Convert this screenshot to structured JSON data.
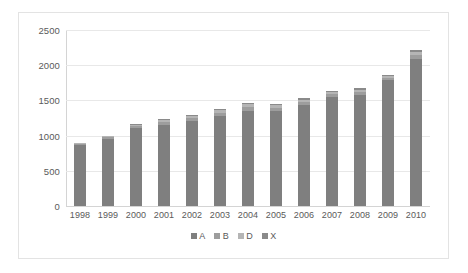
{
  "chart_data": {
    "type": "bar",
    "subtype": "stacked",
    "title": "",
    "xlabel": "",
    "ylabel": "",
    "ylim": [
      0,
      2500
    ],
    "yticks": [
      0,
      500,
      1000,
      1500,
      2000,
      2500
    ],
    "ytick_labels": [
      "0",
      "500",
      "1000",
      "1500",
      "2000",
      "2500"
    ],
    "grid": true,
    "legend_position": "bottom",
    "categories": [
      "1998",
      "1999",
      "2000",
      "2001",
      "2002",
      "2003",
      "2004",
      "2005",
      "2006",
      "2007",
      "2008",
      "2009",
      "2010"
    ],
    "series": [
      {
        "name": "A",
        "color": "#7f7f7f",
        "values": [
          860,
          955,
          1105,
          1150,
          1210,
          1275,
          1355,
          1345,
          1430,
          1545,
          1580,
          1785,
          2085
        ]
      },
      {
        "name": "B",
        "color": "#9d9d9d",
        "values": [
          25,
          22,
          28,
          38,
          42,
          50,
          52,
          48,
          45,
          42,
          40,
          35,
          55
        ]
      },
      {
        "name": "D",
        "color": "#b5b5b5",
        "values": [
          10,
          12,
          18,
          28,
          32,
          38,
          40,
          38,
          35,
          32,
          30,
          25,
          45
        ]
      },
      {
        "name": "X",
        "color": "#8a8a8a",
        "values": [
          5,
          11,
          9,
          14,
          16,
          17,
          23,
          19,
          20,
          21,
          20,
          15,
          25
        ]
      }
    ],
    "totals": [
      900,
      1000,
      1160,
      1230,
      1300,
      1380,
      1470,
      1450,
      1530,
      1640,
      1670,
      1860,
      2210
    ]
  },
  "legend": {
    "items": [
      {
        "label": "A",
        "color": "#7f7f7f"
      },
      {
        "label": "B",
        "color": "#9d9d9d"
      },
      {
        "label": "D",
        "color": "#b5b5b5"
      },
      {
        "label": "X",
        "color": "#8a8a8a"
      }
    ]
  },
  "style": {
    "plot_background": "#ffffff",
    "frame_border": "#e3e3e3",
    "gridline_color": "#e8e8e8",
    "axis_color": "#d4d4d4",
    "tick_text_color": "#5a5a5a"
  }
}
